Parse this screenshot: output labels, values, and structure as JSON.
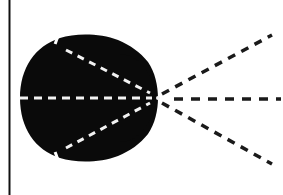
{
  "diagram": {
    "colors": {
      "background": "#ffffff",
      "blob": "#0a0a0a",
      "border": "#111111",
      "inner_dash": "#f2f2f2",
      "outer_dash": "#1a1a1a"
    },
    "focal_point": {
      "x": 158,
      "y": 98
    },
    "inner_rays": [
      {
        "name": "upper",
        "from": [
          62,
          47
        ],
        "to": [
          150,
          93
        ]
      },
      {
        "name": "middle",
        "from": [
          20,
          98
        ],
        "to": [
          152,
          98
        ]
      },
      {
        "name": "lower",
        "from": [
          62,
          150
        ],
        "to": [
          150,
          103
        ]
      }
    ],
    "outer_rays": [
      {
        "name": "upper",
        "from": [
          162,
          94
        ],
        "to": [
          272,
          35
        ]
      },
      {
        "name": "middle",
        "from": [
          172,
          99
        ],
        "to": [
          280,
          99
        ]
      },
      {
        "name": "lower",
        "from": [
          162,
          103
        ],
        "to": [
          272,
          164
        ]
      }
    ]
  }
}
